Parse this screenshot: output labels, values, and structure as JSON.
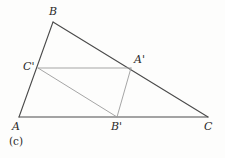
{
  "figure": {
    "caption": "(c)",
    "caption_position": {
      "x": 9,
      "y": 136
    },
    "canvas": {
      "width": 225,
      "height": 158
    },
    "background_color": "#fdfdfc",
    "outer_stroke_color": "#4a4a4a",
    "inner_stroke_color": "#9b9b9b",
    "outer_stroke_width": 1.1,
    "inner_stroke_width": 0.9,
    "points": {
      "A": {
        "label": "A",
        "x": 19,
        "y": 117,
        "label_x": 12,
        "label_y": 121
      },
      "B": {
        "label": "B",
        "x": 53,
        "y": 22,
        "label_x": 49,
        "label_y": 6
      },
      "C": {
        "label": "C",
        "x": 208,
        "y": 117,
        "label_x": 204,
        "label_y": 121
      },
      "Ap": {
        "label": "A'",
        "x": 131,
        "y": 68,
        "label_x": 134,
        "label_y": 54
      },
      "Bp": {
        "label": "B'",
        "x": 117,
        "y": 117,
        "label_x": 111,
        "label_y": 121
      },
      "Cp": {
        "label": "C'",
        "x": 38,
        "y": 68,
        "label_x": 23,
        "label_y": 61
      }
    },
    "segments": [
      {
        "name": "side-AB",
        "from": "A",
        "to": "B",
        "style": "outer"
      },
      {
        "name": "side-BC",
        "from": "B",
        "to": "C",
        "style": "outer"
      },
      {
        "name": "side-AC",
        "from": "A",
        "to": "C",
        "style": "outer"
      },
      {
        "name": "segment-CpAp",
        "from": "Cp",
        "to": "Ap",
        "style": "inner"
      },
      {
        "name": "segment-CpBp",
        "from": "Cp",
        "to": "Bp",
        "style": "inner"
      },
      {
        "name": "segment-ApBp",
        "from": "Ap",
        "to": "Bp",
        "style": "inner"
      }
    ]
  }
}
